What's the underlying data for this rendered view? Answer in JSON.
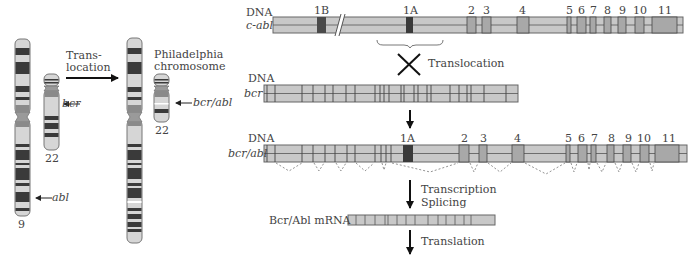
{
  "left_panel": {
    "chr9_label": "9",
    "chr22_label": "22",
    "ph_chr22_label": "22",
    "abl_label": "abl",
    "bcr_label": "bcr",
    "bcr_abl_label": "bcr/abl",
    "translocation_line1": "Trans-",
    "translocation_line2": "location",
    "philadelphia_line1": "Philadelphia",
    "philadelphia_line2": "chromosome"
  },
  "c_abl": {
    "dna_label": "DNA",
    "gene_label": "c-abl",
    "exon_labels": [
      "1B",
      "1A",
      "2",
      "3",
      "4",
      "5",
      "6",
      "7",
      "8",
      "9",
      "10",
      "11"
    ]
  },
  "translocation_label": "Translocation",
  "bcr": {
    "dna_label": "DNA",
    "gene_label": "bcr"
  },
  "bcr_abl": {
    "dna_label": "DNA",
    "gene_label": "bcr/abl",
    "exon_labels": [
      "1A",
      "2",
      "3",
      "4",
      "5",
      "6",
      "7",
      "8",
      "9",
      "10",
      "11"
    ]
  },
  "transcription_label": "Transcription",
  "splicing_label": "Splicing",
  "mrna_label": "Bcr/Abl mRNA",
  "translation_label": "Translation",
  "colors": {
    "gene_fill": "#c8c8c8",
    "exon_dark": "#4a4a4a",
    "exon_mid": "#a8a8a8",
    "outline": "#555555",
    "band_dark": "#3a3a3a",
    "band_mid": "#8a8a8a"
  }
}
